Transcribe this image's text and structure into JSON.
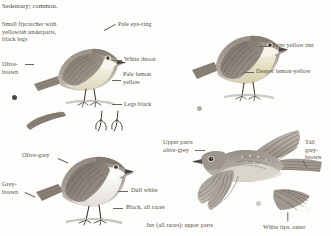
{
  "page": {
    "width": 331,
    "height": 236,
    "background": "#fdfdfb",
    "ink": "#534d47"
  },
  "header": {
    "status_line": "Sedentary; common.",
    "description": "Small flycatcher with\nyellowish underparts,\nblack legs"
  },
  "annotations": [
    {
      "id": "pale-eye-ring",
      "label": "Pale eye-ring",
      "x": 118,
      "y": 24
    },
    {
      "id": "white-throat",
      "label": "White throat",
      "x": 124,
      "y": 58
    },
    {
      "id": "olive-brown",
      "label": "Olive-\nbrown",
      "x": 2,
      "y": 63
    },
    {
      "id": "pale-lemon-yellow",
      "label": "Pale lemon\nyellow",
      "x": 123,
      "y": 73
    },
    {
      "id": "legs-black",
      "label": "Legs black",
      "x": 124,
      "y": 102
    },
    {
      "id": "faint-yellow-tint",
      "label": "Faint yellow tint",
      "x": 272,
      "y": 44
    },
    {
      "id": "deeper-lemon",
      "label": "Deeper lemon-yellow",
      "x": 256,
      "y": 70
    },
    {
      "id": "olive-grey",
      "label": "Olive-grey",
      "x": 22,
      "y": 154
    },
    {
      "id": "grey-brown",
      "label": "Grey-\nbrown",
      "x": 2,
      "y": 183
    },
    {
      "id": "dull-white",
      "label": "Dull white",
      "x": 131,
      "y": 189
    },
    {
      "id": "black-all-races",
      "label": "Black, all races",
      "x": 126,
      "y": 206
    },
    {
      "id": "upper-parts-olive",
      "label": "Upper parts\nolive-grey",
      "x": 163,
      "y": 141
    },
    {
      "id": "tail-grey-brown",
      "label": "Tail\ngrey-\nbrown",
      "x": 305,
      "y": 141
    },
    {
      "id": "juv-all-races",
      "label": "Juv (all races): upper parts",
      "x": 146,
      "y": 224
    },
    {
      "id": "white-tips-outer",
      "label": "White tips, outer",
      "x": 263,
      "y": 226
    }
  ],
  "leaders": [
    {
      "id": "leader-pale-eye-ring",
      "x": 104,
      "y": 30,
      "w": 13,
      "rot": -28
    },
    {
      "id": "leader-white-throat",
      "x": 112,
      "y": 60,
      "w": 10,
      "rot": 0
    },
    {
      "id": "leader-olive-brown",
      "x": 25,
      "y": 64,
      "w": 9,
      "rot": 0
    },
    {
      "id": "leader-pale-lemon",
      "x": 112,
      "y": 80,
      "w": 9,
      "rot": 0
    },
    {
      "id": "leader-legs-black",
      "x": 112,
      "y": 104,
      "w": 10,
      "rot": 0
    },
    {
      "id": "leader-faint-yellow",
      "x": 260,
      "y": 46,
      "w": 10,
      "rot": 0
    },
    {
      "id": "leader-deeper-lemon",
      "x": 244,
      "y": 72,
      "w": 10,
      "rot": 0
    },
    {
      "id": "leader-olive-grey",
      "x": 58,
      "y": 158,
      "w": 11,
      "rot": 24
    },
    {
      "id": "leader-grey-brown",
      "x": 25,
      "y": 192,
      "w": 11,
      "rot": 24
    },
    {
      "id": "leader-dull-white",
      "x": 118,
      "y": 191,
      "w": 10,
      "rot": 0
    },
    {
      "id": "leader-black-races",
      "x": 113,
      "y": 208,
      "w": 10,
      "rot": 0
    },
    {
      "id": "leader-upper-parts",
      "x": 195,
      "y": 150,
      "w": 10,
      "rot": 0
    },
    {
      "id": "leader-tail-grey",
      "x": 303,
      "y": 160,
      "w": 8,
      "rot": 60
    },
    {
      "id": "leader-white-tips",
      "x": 288,
      "y": 212,
      "w": 9,
      "rot": 90
    }
  ],
  "markers": [
    {
      "id": "marker-dark-dot",
      "x": 12,
      "y": 95,
      "size": 5,
      "color": "#4d4741"
    },
    {
      "id": "marker-mid-dot",
      "x": 197,
      "y": 106,
      "size": 5,
      "color": "#b3ada6"
    },
    {
      "id": "marker-light-dot",
      "x": 256,
      "y": 201,
      "size": 5,
      "color": "#cdc8c2"
    }
  ],
  "plates": [
    {
      "id": "plate-adult-left",
      "name": "perched-flycatcher-left"
    },
    {
      "id": "plate-adult-right",
      "name": "perched-flycatcher-right"
    },
    {
      "id": "plate-adult-lower",
      "name": "perched-flycatcher-lower"
    },
    {
      "id": "plate-flying",
      "name": "flying-flycatcher"
    },
    {
      "id": "plate-wing-small",
      "name": "wing-detail-small"
    },
    {
      "id": "plate-feet-detail",
      "name": "feet-detail"
    },
    {
      "id": "plate-tail-detail",
      "name": "tail-detail"
    }
  ],
  "colors": {
    "olive_brown": "#8c8275",
    "olive_grey": "#968f85",
    "grey_brown": "#8b8077",
    "lemon_yellow": "#e8e2c4",
    "dull_white": "#f2f0ec",
    "legs_black": "#3b3732",
    "ink": "#534d47"
  }
}
